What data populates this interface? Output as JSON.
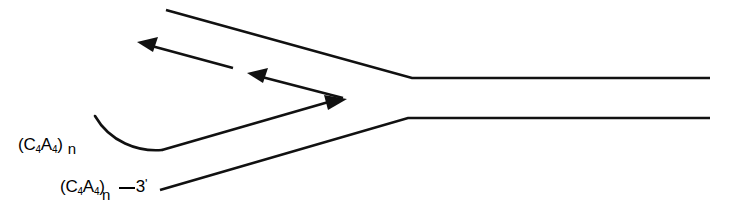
{
  "figure": {
    "kind": "schematic-line-diagram",
    "background_color": "#ffffff",
    "stroke_color": "#111111",
    "width": 731,
    "height": 220,
    "labels": {
      "upper": {
        "full_text": "(C4A4) n",
        "open_paren": "(",
        "base1": "C",
        "sub1": "4",
        "base2": "A",
        "sub2": "4",
        "close_paren": ")",
        "repeat_subscript": "n"
      },
      "lower": {
        "full_text": "(C4A4)n-3'",
        "open_paren": "(",
        "base1": "C",
        "sub1": "4",
        "base2": "A",
        "sub2": "4",
        "close_paren": ")",
        "repeat_subscript": "n",
        "terminus": "3",
        "prime": "'"
      }
    },
    "strands": {
      "top_strand": "M 166,10 L 412,78 L 710,78",
      "bottom_strand": "M 160,190 L 408,118 L 710,118"
    },
    "hook": {
      "curve": "M 95,116 C 110,143 140,152 162,150",
      "tail": "M 162,150 L 330,101"
    },
    "arrows": [
      {
        "name": "long-leftward-arrow",
        "line": "M 232,68 L 146,45",
        "tip": [
          139,
          43
        ],
        "direction": "up-left"
      },
      {
        "name": "short-leftward-arrow",
        "line": "M 341,97 L 257,76",
        "tip": [
          249,
          74
        ],
        "direction": "up-left"
      },
      {
        "name": "rightward-arrow",
        "line": "M 162,150 L 331,101",
        "tip": [
          346,
          99
        ],
        "direction": "up-right"
      }
    ]
  }
}
